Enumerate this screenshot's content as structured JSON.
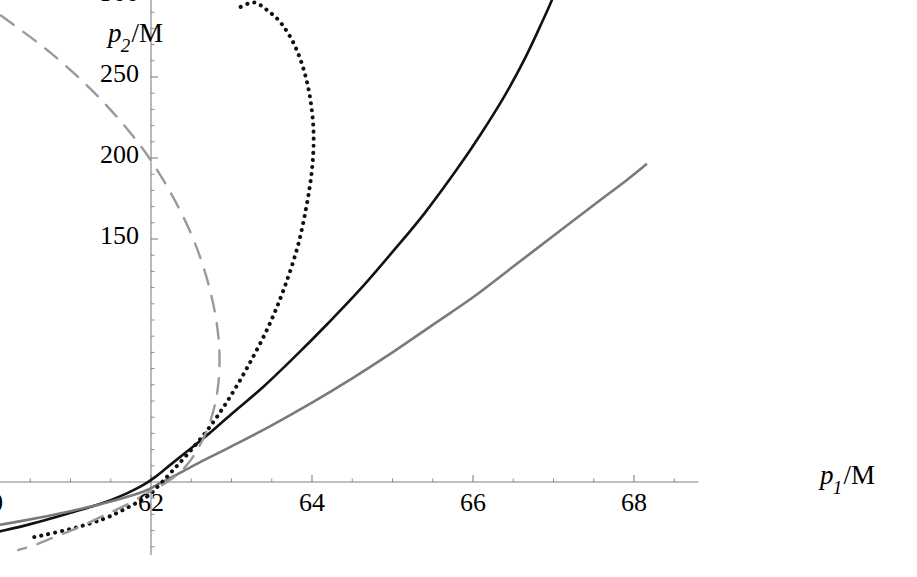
{
  "chart_data": {
    "type": "line",
    "title": "",
    "xlabel": "p_1/M",
    "ylabel": "p_2/M",
    "xlabel_parts": {
      "var": "p",
      "sub": "1",
      "slash": "/",
      "unit": "M"
    },
    "ylabel_parts": {
      "var": "p",
      "sub": "2",
      "slash": "/",
      "unit": "M"
    },
    "xlim": [
      58.6,
      68.8
    ],
    "ylim": [
      -45,
      345
    ],
    "grid": false,
    "legend": "none",
    "x_ticks_major": [
      60,
      62,
      64,
      66,
      68
    ],
    "x_tick_labels": [
      "60",
      "62",
      "64",
      "66",
      "68"
    ],
    "y_ticks_major": [
      150,
      200,
      250,
      300
    ],
    "y_tick_labels": [
      "150",
      "200",
      "250",
      "300"
    ],
    "x_minor_step": 0.5,
    "y_minor_step": 10,
    "axis_origin": {
      "x": 62.0,
      "y": 0
    },
    "axis_color": "#808080",
    "series": [
      {
        "name": "solid-black-curve",
        "style": "solid",
        "color": "#111111",
        "width": 2.6,
        "points": [
          [
            59.17,
            -42
          ],
          [
            59.6,
            -37
          ],
          [
            60.0,
            -32
          ],
          [
            60.5,
            -26
          ],
          [
            61.0,
            -19
          ],
          [
            61.4,
            -13
          ],
          [
            61.7,
            -7
          ],
          [
            61.9,
            -2
          ],
          [
            62.05,
            3
          ],
          [
            62.2,
            9
          ],
          [
            62.4,
            17
          ],
          [
            62.7,
            29
          ],
          [
            63.0,
            42
          ],
          [
            63.4,
            59
          ],
          [
            63.8,
            78
          ],
          [
            64.2,
            98
          ],
          [
            64.6,
            119
          ],
          [
            65.0,
            142
          ],
          [
            65.4,
            166
          ],
          [
            65.8,
            193
          ],
          [
            66.1,
            215
          ],
          [
            66.4,
            239
          ],
          [
            66.65,
            262
          ],
          [
            66.85,
            283
          ],
          [
            67.0,
            300
          ],
          [
            67.12,
            318
          ],
          [
            67.2,
            334
          ],
          [
            67.26,
            350
          ],
          [
            67.3,
            366
          ],
          [
            67.33,
            382
          ],
          [
            67.35,
            398
          ],
          [
            67.36,
            410
          ]
        ]
      },
      {
        "name": "solid-gray-curve",
        "style": "solid",
        "color": "#7a7a7a",
        "width": 2.6,
        "points": [
          [
            58.65,
            -39
          ],
          [
            59.2,
            -34
          ],
          [
            59.8,
            -29
          ],
          [
            60.4,
            -24
          ],
          [
            61.0,
            -18
          ],
          [
            61.5,
            -12
          ],
          [
            61.9,
            -6
          ],
          [
            62.1,
            -1
          ],
          [
            62.3,
            4
          ],
          [
            62.6,
            12
          ],
          [
            63.0,
            22
          ],
          [
            63.5,
            35
          ],
          [
            64.0,
            49
          ],
          [
            64.5,
            64
          ],
          [
            65.0,
            80
          ],
          [
            65.5,
            97
          ],
          [
            66.0,
            114
          ],
          [
            66.5,
            133
          ],
          [
            67.0,
            152
          ],
          [
            67.5,
            171
          ],
          [
            67.9,
            186
          ],
          [
            68.15,
            196
          ]
        ]
      },
      {
        "name": "dotted-black-curve",
        "style": "dotted",
        "color": "#111111",
        "width": 4.0,
        "points": [
          [
            60.55,
            -34
          ],
          [
            61.0,
            -29
          ],
          [
            61.4,
            -23
          ],
          [
            61.7,
            -16
          ],
          [
            61.95,
            -9
          ],
          [
            62.1,
            -2
          ],
          [
            62.25,
            6
          ],
          [
            62.45,
            17
          ],
          [
            62.7,
            32
          ],
          [
            62.95,
            50
          ],
          [
            63.2,
            71
          ],
          [
            63.45,
            95
          ],
          [
            63.65,
            119
          ],
          [
            63.82,
            145
          ],
          [
            63.93,
            170
          ],
          [
            64.0,
            193
          ],
          [
            64.02,
            215
          ],
          [
            63.98,
            236
          ],
          [
            63.9,
            254
          ],
          [
            63.78,
            270
          ],
          [
            63.62,
            283
          ],
          [
            63.45,
            291
          ],
          [
            63.28,
            296
          ],
          [
            63.1,
            293
          ]
        ]
      },
      {
        "name": "dashed-gray-curve",
        "style": "dashed",
        "color": "#9a9a9a",
        "width": 2.4,
        "points": [
          [
            59.0,
            326
          ],
          [
            59.4,
            313
          ],
          [
            59.85,
            298
          ],
          [
            60.3,
            282
          ],
          [
            60.75,
            265
          ],
          [
            61.2,
            245
          ],
          [
            61.6,
            224
          ],
          [
            61.95,
            202
          ],
          [
            62.25,
            178
          ],
          [
            62.5,
            153
          ],
          [
            62.68,
            128
          ],
          [
            62.8,
            103
          ],
          [
            62.85,
            80
          ],
          [
            62.83,
            58
          ],
          [
            62.74,
            38
          ],
          [
            62.6,
            22
          ],
          [
            62.42,
            9
          ],
          [
            62.2,
            0
          ],
          [
            61.95,
            -7
          ],
          [
            61.7,
            -14
          ],
          [
            61.4,
            -21
          ],
          [
            61.1,
            -28
          ],
          [
            60.8,
            -34
          ],
          [
            60.55,
            -39
          ],
          [
            60.35,
            -42
          ]
        ]
      }
    ]
  },
  "axes": {
    "x_axis_name": "horizontal-axis",
    "y_axis_name": "vertical-axis"
  }
}
